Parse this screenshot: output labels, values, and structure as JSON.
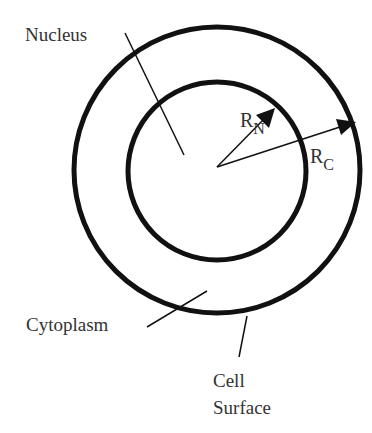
{
  "diagram": {
    "type": "cell-schematic",
    "labels": {
      "nucleus": "Nucleus",
      "cytoplasm": "Cytoplasm",
      "cell_surface_line1": "Cell",
      "cell_surface_line2": "Surface",
      "rn_main": "R",
      "rn_sub": "N",
      "rc_main": "R",
      "rc_sub": "C"
    },
    "colors": {
      "stroke": "#111111",
      "text": "#333333",
      "background": "#ffffff"
    }
  }
}
